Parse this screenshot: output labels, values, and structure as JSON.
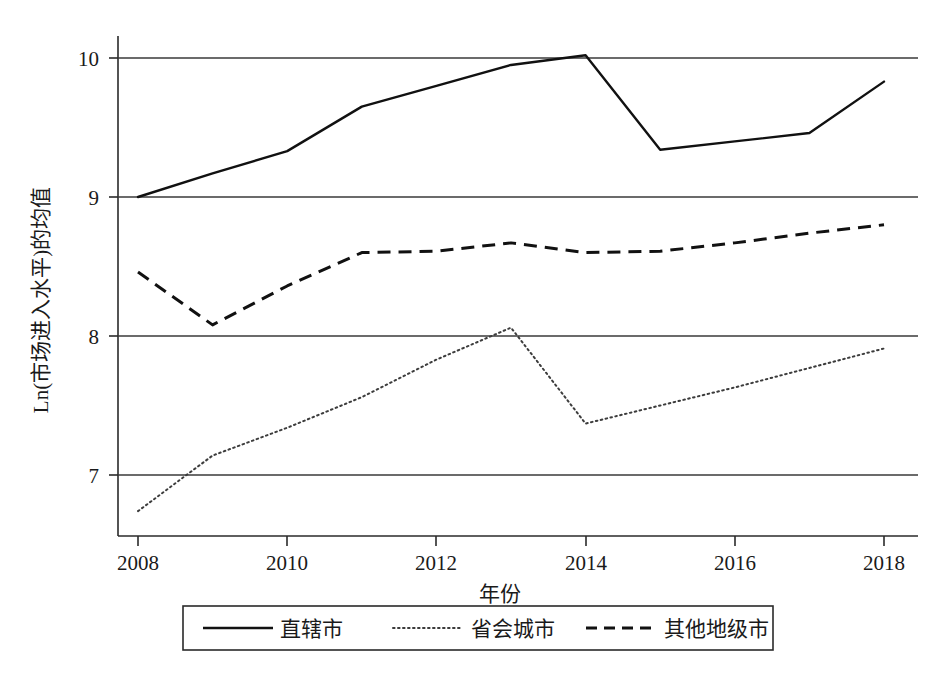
{
  "chart_data": {
    "type": "line",
    "title": "",
    "xlabel": "年份",
    "ylabel": "Ln(市场进入水平)的均值",
    "x": [
      2008,
      2009,
      2010,
      2011,
      2012,
      2013,
      2014,
      2015,
      2016,
      2017,
      2018
    ],
    "xlim": [
      2008,
      2018
    ],
    "ylim": [
      6.6,
      10.25
    ],
    "xticks": [
      "2008",
      "2010",
      "2012",
      "2014",
      "2016",
      "2018"
    ],
    "xtick_values": [
      2008,
      2010,
      2012,
      2014,
      2016,
      2018
    ],
    "yticks": [
      "7",
      "8",
      "9",
      "10"
    ],
    "ytick_values": [
      7,
      8,
      9,
      10
    ],
    "grid": "horizontal",
    "legend_position": "bottom",
    "series": [
      {
        "name": "直辖市",
        "style": "solid",
        "color": "#111111",
        "values": [
          9.0,
          9.17,
          9.33,
          9.65,
          9.8,
          9.95,
          10.02,
          9.34,
          9.4,
          9.46,
          9.83
        ]
      },
      {
        "name": "省会城市",
        "style": "dotted",
        "color": "#3c3c3c",
        "values": [
          6.74,
          7.14,
          7.34,
          7.56,
          7.83,
          8.06,
          7.37,
          7.5,
          7.63,
          7.77,
          7.91
        ]
      },
      {
        "name": "其他地级市",
        "style": "dashed",
        "color": "#111111",
        "values": [
          8.46,
          8.08,
          8.36,
          8.6,
          8.61,
          8.67,
          8.6,
          8.61,
          8.67,
          8.74,
          8.8
        ]
      }
    ]
  },
  "axes": {
    "y_axis_label": "Ln(市场进入水平)的均值",
    "x_axis_label": "年份"
  },
  "legend": {
    "items": [
      {
        "label": "直辖市",
        "style": "solid"
      },
      {
        "label": "省会城市",
        "style": "dotted"
      },
      {
        "label": "其他地级市",
        "style": "dashed"
      }
    ]
  }
}
